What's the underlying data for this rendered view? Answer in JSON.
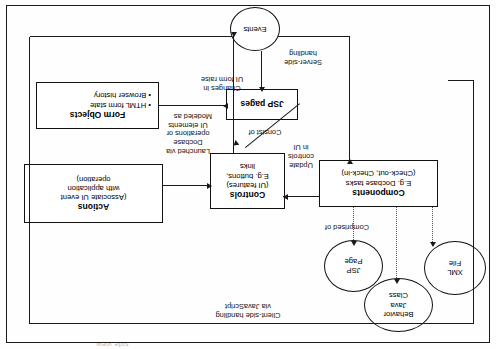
{
  "diagram": {
    "title_fragment": "side view",
    "nodes": {
      "events": {
        "label": "Events",
        "shape": "circle"
      },
      "actions": {
        "title": "Actions",
        "line1": "(Associate UI event",
        "line2": "with application",
        "line3": "operation)",
        "shape": "box"
      },
      "controls": {
        "title": "Controls",
        "line1": "(UI features)",
        "line2": "E.g. buttons,",
        "line3": "links",
        "shape": "box"
      },
      "components": {
        "title": "Components",
        "line1": "E.g. Docbase tasks",
        "line2": "(Check-out, Check-in)",
        "shape": "box"
      },
      "jsp_pages": {
        "title": "JSP pages",
        "shape": "box"
      },
      "form_objects": {
        "title": "Form Objects",
        "bullet1": "• HTML form state",
        "bullet2": "• Browser history",
        "shape": "box"
      },
      "jsp_page": {
        "line1": "JSP",
        "line2": "Page",
        "shape": "ellipse"
      },
      "behavior_java_class": {
        "line1": "Behavior",
        "line2": "Java",
        "line3": "Class",
        "shape": "ellipse"
      },
      "xml_file": {
        "line1": "XML",
        "line2": "File",
        "shape": "ellipse"
      }
    },
    "edges": {
      "changes_raise": "Changes in\nUI form raise",
      "launched_via": "Launched via\nDocbase\noperations or\nUI elements",
      "update_controls": "Update\ncontrols\nin UI",
      "server_side": "Server-side\nhandling",
      "consist_of": "Consist of",
      "comprised_of": "Comprised of",
      "modeled_as": "Modeled as",
      "client_side": "Client-side handling\nvia JavaScript"
    }
  }
}
